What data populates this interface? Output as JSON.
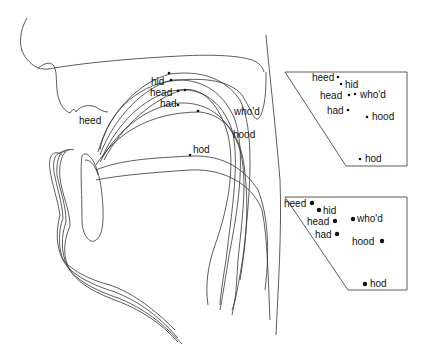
{
  "diagram": {
    "colors": {
      "line": "#333333",
      "text": "#111111",
      "background": "#ffffff"
    },
    "tongue_labels": {
      "heed": "heed",
      "hid": "hid",
      "head": "head",
      "had": "had",
      "whod": "who'd",
      "hood": "hood",
      "hod": "hod"
    },
    "chart_top": {
      "labels": {
        "heed": "heed",
        "hid": "hid",
        "head": "head",
        "whod": "who'd",
        "had": "had",
        "hood": "hood",
        "hod": "hod"
      }
    },
    "chart_bottom": {
      "labels": {
        "heed": "heed",
        "hid": "hid",
        "head": "head",
        "whod": "who'd",
        "had": "had",
        "hood": "hood",
        "hod": "hod"
      }
    }
  }
}
